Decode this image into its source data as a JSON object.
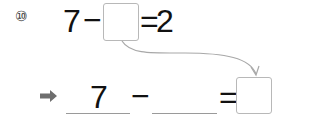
{
  "problem": {
    "number_label": "⑩",
    "equation": {
      "minuend": "7",
      "operator": "−",
      "blank_value": "",
      "equals": "=",
      "result": "2"
    }
  },
  "answer_row": {
    "arrow_icon": "right-arrow-icon",
    "first_value": "7",
    "operator": "−",
    "second_value": "",
    "equals": "=",
    "answer_value": ""
  },
  "colors": {
    "box_border": "#b8b8b8",
    "connector": "#a8a8a8",
    "arrow": "#6e6e6e"
  }
}
